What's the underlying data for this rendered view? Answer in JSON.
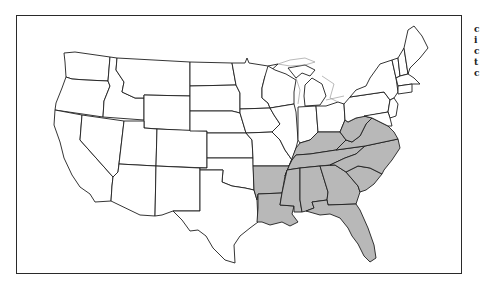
{
  "figure": {
    "type": "choropleth-outline-map",
    "shade_color": "#b8b8b8",
    "outline_color": "#1e1e1e",
    "background": "#ffffff"
  },
  "highlighted_states": [
    "Arkansas",
    "Louisiana",
    "Mississippi",
    "Alabama",
    "Georgia",
    "Florida",
    "South Carolina",
    "North Carolina",
    "Tennessee",
    "Kentucky",
    "Virginia",
    "West Virginia"
  ],
  "side_text": {
    "note": "Text cut off at right edge; only first glyph fragments visible",
    "lines": [
      "c",
      "i",
      "c",
      "t",
      "c"
    ]
  }
}
